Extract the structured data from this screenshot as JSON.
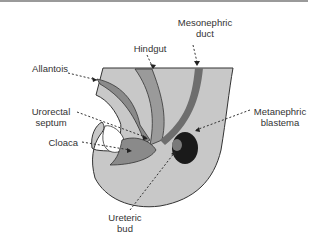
{
  "figure": {
    "labels": {
      "mesonephric_duct": [
        "Mesonephric",
        "duct"
      ],
      "hindgut": "Hindgut",
      "allantois": "Allantois",
      "urorectal_septum": [
        "Urorectal",
        "septum"
      ],
      "cloaca": "Cloaca",
      "metanephric_blastema": [
        "Metanephric",
        "blastema"
      ],
      "ureteric_bud": [
        "Ureteric",
        "bud"
      ]
    },
    "colors": {
      "tissue": "#c8c8c8",
      "tube": "#8a8a8a",
      "duct": "#6e6e6e",
      "blastema": "#1a1a1a",
      "outline": "#333333",
      "leader": "#333333"
    }
  }
}
